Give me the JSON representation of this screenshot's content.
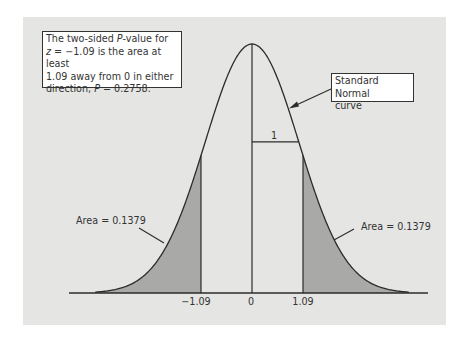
{
  "chart_data": {
    "type": "area",
    "title": "",
    "distribution": "standard normal",
    "z_statistic": -1.09,
    "x_ticks": [
      "-1.09",
      "0",
      "1.09"
    ],
    "x_tick_values": [
      -1.09,
      0,
      1.09
    ],
    "shaded_regions": [
      {
        "from": "-inf",
        "to": -1.09,
        "area": 0.1379,
        "label": "Area = 0.1379"
      },
      {
        "from": 1.09,
        "to": "inf",
        "area": 0.1379,
        "label": "Area = 0.1379"
      }
    ],
    "p_value": 0.2758,
    "sd_marker": {
      "label": "1",
      "from": 0,
      "to": 1
    },
    "xlabel": "",
    "ylabel": "",
    "grid": false,
    "colors": {
      "panel": "#e5e5e4",
      "shade": "#a9a9a8",
      "line": "#2b2b2b"
    }
  },
  "annotations": {
    "pvalue_box": {
      "line1_pre": "The two-sided ",
      "line1_p": "P",
      "line1_post": "-value for",
      "line2_z": "z",
      "line2_post": " = −1.09 is the area at least",
      "line3": "1.09 away from 0 in either",
      "line4_pre": "direction, ",
      "line4_p": "P",
      "line4_post": " = 0.2758."
    },
    "curve_box": {
      "line1": "Standard Normal",
      "line2": "curve"
    },
    "left_area": "Area = 0.1379",
    "right_area": "Area = 0.1379",
    "sd_label": "1"
  },
  "ticks": {
    "neg": "−1.09",
    "zero": "0",
    "pos": "1.09"
  }
}
